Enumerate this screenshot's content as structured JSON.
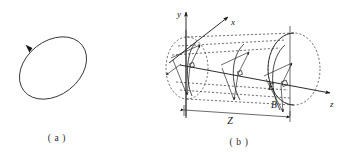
{
  "figure": {
    "background_color": "#ffffff",
    "ink_color": "#141414",
    "panels": [
      {
        "id": "a",
        "caption": "( a )",
        "kind": "polarization-ellipse",
        "description": "Tilted ellipse with a single direction arrowhead on the upper-left arc",
        "ellipse": {
          "center_x": 53,
          "center_y": 68,
          "radius_x": 36,
          "radius_y": 26,
          "rotation_deg": -38
        },
        "direction_arrow": {
          "name": "rotation-direction-arrowhead",
          "at_x": 28,
          "at_y": 48,
          "angle_deg": -118
        }
      },
      {
        "id": "b",
        "caption": "( b )",
        "kind": "cylinder-field-propagation",
        "description": "Cylinder aligned with z axis showing perpendicular E and B vectors at three cross sections",
        "axes": [
          {
            "name": "y-axis",
            "label": "y",
            "label_x": 178,
            "label_y": 14,
            "direction": "up"
          },
          {
            "name": "x-axis",
            "label": "x",
            "label_x": 232,
            "label_y": 23,
            "direction": "up-right"
          },
          {
            "name": "z-axis",
            "label": "z",
            "label_x": 332,
            "label_y": 105,
            "direction": "right"
          }
        ],
        "field_labels": [
          {
            "name": "electric-field-label",
            "label": "E",
            "x": 271,
            "y": 88
          },
          {
            "name": "magnetic-field-label",
            "label": "B",
            "x": 274,
            "y": 105
          }
        ],
        "right_angle_marker": {
          "name": "right-angle-marker",
          "x": 285,
          "y": 86,
          "size": 5
        },
        "dimension": {
          "name": "z-length-dimension",
          "label": "Z",
          "label_x": 230,
          "label_y": 122,
          "start_x": 182,
          "end_x": 290,
          "y": 112
        },
        "cross_sections": [
          {
            "name": "cross-section-1",
            "cx": 190,
            "position": "left-end"
          },
          {
            "name": "cross-section-2",
            "cx": 237,
            "position": "middle"
          },
          {
            "name": "cross-section-3",
            "cx": 281,
            "position": "right"
          }
        ],
        "end_circle": {
          "name": "cylinder-right-end-circle",
          "cx": 295,
          "cy": 70,
          "rx": 26,
          "ry": 36
        },
        "start_circle": {
          "name": "cylinder-left-end-circle",
          "cx": 184,
          "cy": 70,
          "rx": 20,
          "ry": 30
        }
      }
    ]
  }
}
